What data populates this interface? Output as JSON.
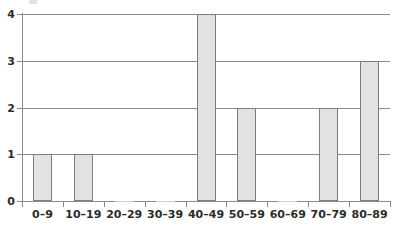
{
  "chart_data": {
    "type": "bar",
    "title": "",
    "subtitle": "",
    "xlabel": "",
    "ylabel": "",
    "categories": [
      "0–9",
      "10–19",
      "20–29",
      "30–39",
      "40–49",
      "50–59",
      "60–69",
      "70–79",
      "80–89"
    ],
    "values": [
      1,
      1,
      0,
      0,
      4,
      2,
      0,
      2,
      3
    ],
    "series": [
      {
        "name": "Frequency",
        "values": [
          1,
          1,
          0,
          0,
          4,
          2,
          0,
          2,
          3
        ]
      }
    ],
    "ylim": [
      0,
      4
    ],
    "xlim": [
      0,
      9
    ],
    "ytick_labels": [
      "0",
      "1",
      "2",
      "3",
      "4"
    ],
    "ytick_values": [
      0,
      1,
      2,
      3,
      4
    ],
    "grid": "horizontal",
    "legend": "none",
    "annotations": [],
    "colors": {
      "bar_fill": "#e2e2e2",
      "bar_stroke": "#7d7d7d",
      "axis": "#8a8a8a",
      "grid": "#8a8a8a",
      "text": "#2b2b2b",
      "background": "#ffffff"
    }
  }
}
